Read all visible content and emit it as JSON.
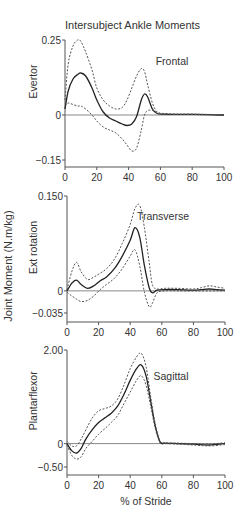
{
  "figure": {
    "title": "Intersubject Ankle Moments",
    "shared_ylabel": "Joint Moment (N.m/kg)",
    "xlabel": "% of Stride"
  },
  "chart_data": [
    {
      "type": "line",
      "title": "Frontal",
      "ylabel": "Evertor",
      "xlabel": "",
      "xlim": [
        0,
        100
      ],
      "ylim": [
        -0.15,
        0.25
      ],
      "xticks": [
        "0",
        "20",
        "40",
        "60",
        "80",
        "100"
      ],
      "yticks": [
        "0.25",
        "0",
        "-0.15"
      ],
      "grid": false,
      "x": [
        0,
        2,
        5,
        8,
        10,
        13,
        17,
        20,
        24,
        28,
        32,
        36,
        39,
        42,
        45,
        48,
        50,
        52,
        55,
        58,
        62,
        70,
        80,
        90,
        100
      ],
      "series": [
        {
          "name": "Mean",
          "style": "solid",
          "values": [
            0.02,
            0.08,
            0.12,
            0.135,
            0.14,
            0.13,
            0.09,
            0.05,
            0.01,
            -0.01,
            -0.02,
            -0.03,
            -0.035,
            -0.03,
            -0.005,
            0.05,
            0.07,
            0.06,
            0.02,
            0.005,
            0.003,
            0.002,
            0.002,
            0.001,
            0.0
          ]
        },
        {
          "name": "Mean + SD",
          "style": "dashed",
          "values": [
            0.05,
            0.17,
            0.23,
            0.25,
            0.245,
            0.21,
            0.15,
            0.09,
            0.05,
            0.03,
            0.02,
            0.025,
            0.05,
            0.09,
            0.13,
            0.155,
            0.145,
            0.1,
            0.04,
            0.01,
            0.005,
            0.003,
            0.003,
            0.002,
            0.001
          ]
        },
        {
          "name": "Mean - SD",
          "style": "dashed",
          "values": [
            0.03,
            0.04,
            0.035,
            0.03,
            0.03,
            0.02,
            0.0,
            -0.02,
            -0.04,
            -0.05,
            -0.06,
            -0.08,
            -0.1,
            -0.12,
            -0.11,
            -0.05,
            0.0,
            0.015,
            0.015,
            0.008,
            0.004,
            0.002,
            0.002,
            0.001,
            0.0
          ]
        }
      ]
    },
    {
      "type": "line",
      "title": "Transverse",
      "ylabel": "Ext rotation",
      "xlabel": "",
      "xlim": [
        0,
        100
      ],
      "ylim": [
        -0.035,
        0.15
      ],
      "xticks": [
        "0",
        "20",
        "40",
        "60",
        "80",
        "100"
      ],
      "yticks": [
        "0.150",
        "0",
        "-0.035"
      ],
      "grid": false,
      "x": [
        0,
        3,
        6,
        9,
        13,
        17,
        21,
        25,
        30,
        35,
        40,
        43,
        46,
        49,
        52,
        54,
        57,
        62,
        70,
        80,
        85,
        90,
        95,
        100
      ],
      "series": [
        {
          "name": "Mean",
          "style": "solid",
          "values": [
            0.0,
            0.012,
            0.017,
            0.01,
            0.004,
            0.008,
            0.016,
            0.022,
            0.035,
            0.055,
            0.08,
            0.1,
            0.085,
            0.04,
            0.005,
            -0.003,
            0.001,
            0.002,
            0.002,
            0.001,
            0.002,
            0.003,
            0.002,
            0.001
          ]
        },
        {
          "name": "Mean + SD",
          "style": "dashed",
          "values": [
            0.002,
            0.03,
            0.045,
            0.03,
            0.018,
            0.022,
            0.028,
            0.035,
            0.05,
            0.075,
            0.105,
            0.13,
            0.135,
            0.1,
            0.045,
            0.01,
            0.003,
            0.004,
            0.004,
            0.003,
            0.005,
            0.008,
            0.006,
            0.004
          ]
        },
        {
          "name": "Mean - SD",
          "style": "dashed",
          "values": [
            -0.002,
            -0.008,
            -0.013,
            -0.017,
            -0.015,
            -0.008,
            0.002,
            0.01,
            0.02,
            0.035,
            0.055,
            0.065,
            0.04,
            -0.002,
            -0.025,
            -0.02,
            -0.003,
            0.0,
            0.0,
            0.0,
            0.0,
            0.0,
            0.0,
            0.0
          ]
        }
      ]
    },
    {
      "type": "line",
      "title": "Sagittal",
      "ylabel": "Plantarflexor",
      "xlabel": "% of Stride",
      "xlim": [
        0,
        100
      ],
      "ylim": [
        -0.5,
        2.0
      ],
      "xticks": [
        "0",
        "20",
        "40",
        "60",
        "80",
        "100"
      ],
      "yticks": [
        "2.00",
        "0",
        "-0.50"
      ],
      "grid": false,
      "x": [
        0,
        3,
        6,
        9,
        12,
        16,
        20,
        24,
        28,
        32,
        36,
        40,
        44,
        47,
        50,
        53,
        56,
        59,
        62,
        70,
        80,
        90,
        100
      ],
      "series": [
        {
          "name": "Mean",
          "style": "solid",
          "values": [
            0.0,
            -0.15,
            -0.2,
            -0.1,
            0.1,
            0.3,
            0.45,
            0.55,
            0.65,
            0.8,
            1.05,
            1.35,
            1.6,
            1.68,
            1.45,
            0.9,
            0.35,
            0.03,
            0.01,
            0.0,
            -0.01,
            -0.03,
            0.0
          ]
        },
        {
          "name": "Mean + SD",
          "style": "dashed",
          "values": [
            0.05,
            -0.05,
            -0.05,
            0.1,
            0.3,
            0.55,
            0.7,
            0.75,
            0.8,
            0.95,
            1.25,
            1.6,
            1.85,
            1.93,
            1.65,
            1.0,
            0.4,
            0.05,
            0.02,
            0.01,
            0.0,
            -0.01,
            0.02
          ]
        },
        {
          "name": "Mean - SD",
          "style": "dashed",
          "values": [
            -0.03,
            -0.25,
            -0.33,
            -0.28,
            -0.1,
            0.05,
            0.2,
            0.32,
            0.45,
            0.6,
            0.85,
            1.1,
            1.35,
            1.45,
            1.25,
            0.8,
            0.3,
            0.01,
            0.0,
            -0.01,
            -0.03,
            -0.05,
            -0.02
          ]
        }
      ]
    }
  ]
}
